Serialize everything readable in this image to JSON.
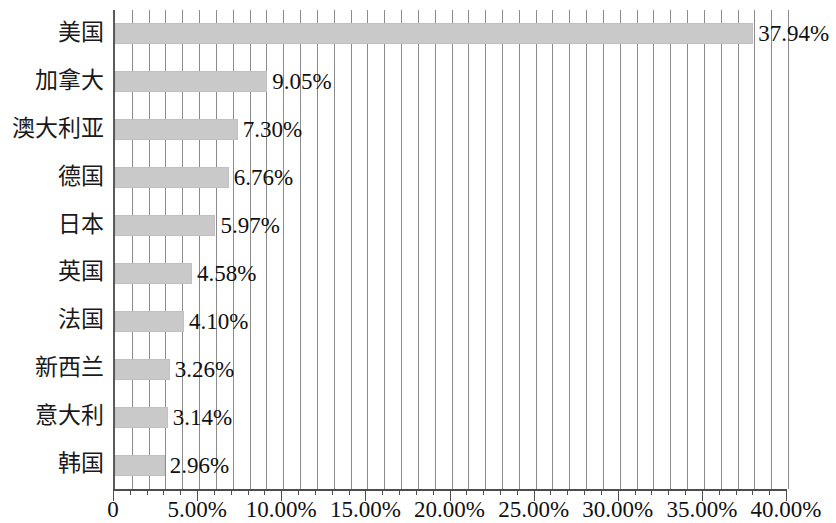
{
  "chart_data": {
    "type": "bar",
    "orientation": "horizontal",
    "title": "",
    "subtitle": "",
    "xlabel": "",
    "ylabel": "",
    "categories": [
      "美国",
      "加拿大",
      "澳大利亚",
      "德国",
      "日本",
      "英国",
      "法国",
      "新西兰",
      "意大利",
      "韩国"
    ],
    "values": [
      37.94,
      9.05,
      7.3,
      6.76,
      5.97,
      4.58,
      4.1,
      3.26,
      3.14,
      2.96
    ],
    "value_labels": [
      "37.94%",
      "9.05%",
      "7.30%",
      "6.76%",
      "5.97%",
      "4.58%",
      "4.10%",
      "3.26%",
      "3.14%",
      "2.96%"
    ],
    "xlim": [
      0,
      40
    ],
    "x_tick_values": [
      0,
      5,
      10,
      15,
      20,
      25,
      30,
      35,
      40
    ],
    "x_tick_labels": [
      "0",
      "5.00%",
      "10.00%",
      "15.00%",
      "20.00%",
      "25.00%",
      "30.00%",
      "35.00%",
      "40.00%"
    ],
    "minor_tick_interval": 1,
    "grid": true,
    "grid_axis": "x",
    "legend": false,
    "legend_position": "none",
    "bar_color": "#c9c9c9",
    "gridline_color": "#8c8c8c",
    "axis_color": "#4d4d4d",
    "unit": "%"
  }
}
